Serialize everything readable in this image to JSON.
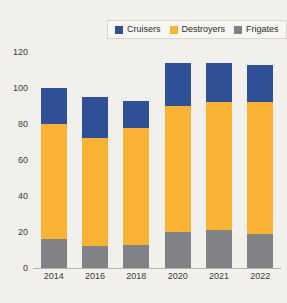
{
  "chart_data": {
    "type": "bar",
    "subtype": "stacked-vertical",
    "title": "",
    "subtitle": "",
    "xlabel": "",
    "ylabel": "",
    "categories": [
      "2014",
      "2016",
      "2018",
      "2020",
      "2021",
      "2022"
    ],
    "series": [
      {
        "name": "Frigates",
        "color": "#808285",
        "values": [
          16,
          12,
          13,
          20,
          21,
          19
        ]
      },
      {
        "name": "Destroyers",
        "color": "#f9b233",
        "values": [
          64,
          60,
          65,
          70,
          71,
          73
        ]
      },
      {
        "name": "Cruisers",
        "color": "#2f4f96",
        "values": [
          20,
          23,
          15,
          24,
          22,
          21
        ]
      }
    ],
    "stack_order_bottom_to_top": [
      "Frigates",
      "Destroyers",
      "Cruisers"
    ],
    "totals": [
      100,
      95,
      93,
      114,
      114,
      113
    ],
    "ylim": [
      0,
      120
    ],
    "yticks": [
      0,
      20,
      40,
      60,
      80,
      100,
      120
    ],
    "ytick_labels": [
      "0",
      "20",
      "40",
      "60",
      "80",
      "100",
      "120"
    ],
    "grid": false,
    "legend_position": "top-right",
    "legend_entries": [
      {
        "label": "Cruisers",
        "color": "#2f4f96"
      },
      {
        "label": "Destroyers",
        "color": "#f9b233"
      },
      {
        "label": "Frigates",
        "color": "#808285"
      }
    ],
    "background_color": "#f2f0ec",
    "axis_color": "#b9b5ae",
    "text_color": "#3a3a3a"
  }
}
